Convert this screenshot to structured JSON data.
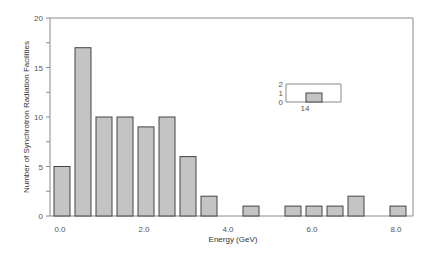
{
  "chart_data": {
    "type": "bar",
    "title": "",
    "xlabel": "Energy (GeV)",
    "ylabel": "Number of Synchrotron Radiation Facilities",
    "bin_width": 0.5,
    "categories": [
      "0.0-0.5",
      "0.5-1.0",
      "1.0-1.5",
      "1.5-2.0",
      "2.0-2.5",
      "2.5-3.0",
      "3.0-3.5",
      "3.5-4.0",
      "4.0-4.5",
      "4.5-5.0",
      "5.0-5.5",
      "5.5-6.0",
      "6.0-6.5",
      "6.5-7.0",
      "7.0-7.5",
      "7.5-8.0",
      "8.0-8.5"
    ],
    "values": [
      5,
      17,
      10,
      10,
      9,
      10,
      6,
      2,
      0,
      1,
      0,
      1,
      1,
      1,
      2,
      0,
      1
    ],
    "ylim": [
      0,
      20
    ],
    "yticks": [
      "0",
      "5",
      "10",
      "15",
      "20"
    ],
    "xticks": [
      "0.0",
      "2.0",
      "4.0",
      "6.0",
      "8.0"
    ],
    "grid": false,
    "inset": {
      "categories": [
        "14"
      ],
      "values": [
        1
      ],
      "ylim": [
        0,
        2
      ],
      "yticks": [
        "0",
        "1",
        "2"
      ],
      "xticks": [
        "14"
      ]
    }
  },
  "colors": {
    "bar_fill": "#c4c4c4",
    "bar_stroke": "#444444",
    "axis": "#8a8a8a"
  }
}
